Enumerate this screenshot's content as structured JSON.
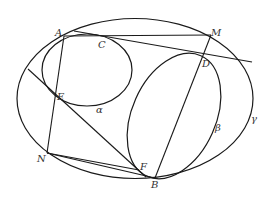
{
  "figure": {
    "width": 274,
    "height": 198,
    "stroke_color": "#1a1a1a",
    "label_color": "#333333",
    "curves": [
      {
        "id": "gamma",
        "label": "γ",
        "type": "ellipse",
        "cx": 135,
        "cy": 98.5,
        "rx": 118,
        "ry": 80,
        "rotate": 0
      },
      {
        "id": "alpha",
        "label": "α",
        "type": "ellipse",
        "cx": 87,
        "cy": 70,
        "rx": 45,
        "ry": 36,
        "rotate": 0
      },
      {
        "id": "beta",
        "label": "β",
        "type": "ellipse",
        "cx": 174,
        "cy": 116,
        "rx": 43,
        "ry": 66,
        "rotate": 25
      }
    ],
    "points": {
      "A": {
        "label": "A",
        "x": 64,
        "y": 36
      },
      "C": {
        "label": "C",
        "x": 104,
        "y": 40
      },
      "M": {
        "label": "M",
        "x": 211,
        "y": 36
      },
      "D": {
        "label": "D",
        "x": 203,
        "y": 56
      },
      "E": {
        "label": "E",
        "x": 56,
        "y": 99
      },
      "N": {
        "label": "N",
        "x": 47,
        "y": 152
      },
      "F": {
        "label": "F",
        "x": 139,
        "y": 170
      },
      "B": {
        "label": "B",
        "x": 155,
        "y": 177
      }
    },
    "labels": {
      "A": "A",
      "C": "C",
      "M": "M",
      "D": "D",
      "E": "E",
      "N": "N",
      "F": "F",
      "B": "B",
      "alpha": "α",
      "beta": "β",
      "gamma": "γ"
    },
    "segments": [
      {
        "from": "A",
        "to": "M"
      },
      {
        "from": "A",
        "to": "N"
      },
      {
        "from": "M",
        "to": "B"
      },
      {
        "from": "N",
        "to": "F"
      },
      {
        "from": "N",
        "to": "B"
      },
      {
        "from": "tangent_C_start",
        "to": "tangent_C_end"
      },
      {
        "from": "line_EF_start",
        "to": "line_EF_end"
      }
    ]
  }
}
